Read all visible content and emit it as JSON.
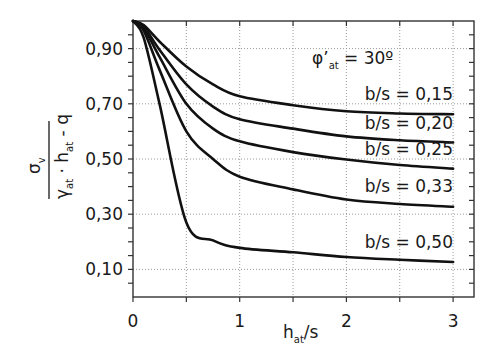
{
  "chart_data": {
    "type": "line",
    "title": "",
    "xlabel": "h_at/s",
    "ylabel": "σ_v / (γ_at · h_at - q)",
    "xlim": [
      0,
      3.2
    ],
    "ylim": [
      0,
      1.0
    ],
    "x_ticks": [
      "0",
      "1",
      "2",
      "3"
    ],
    "y_ticks": [
      "0,10",
      "0,30",
      "0,50",
      "0,70",
      "0,90"
    ],
    "grid": true,
    "annotation": "φ'at = 30º",
    "x": [
      0,
      0.1,
      0.25,
      0.5,
      0.75,
      1.0,
      1.5,
      2.0,
      2.5,
      3.0
    ],
    "series": [
      {
        "name": "b/s = 0,15",
        "values": [
          1.0,
          0.985,
          0.925,
          0.835,
          0.77,
          0.727,
          0.695,
          0.673,
          0.665,
          0.662
        ]
      },
      {
        "name": "b/s = 0,20",
        "values": [
          1.0,
          0.98,
          0.895,
          0.77,
          0.69,
          0.644,
          0.61,
          0.582,
          0.568,
          0.56
        ]
      },
      {
        "name": "b/s = 0,25",
        "values": [
          1.0,
          0.975,
          0.869,
          0.7,
          0.61,
          0.564,
          0.525,
          0.498,
          0.478,
          0.465
        ]
      },
      {
        "name": "b/s = 0,33",
        "values": [
          1.0,
          0.965,
          0.822,
          0.6,
          0.5,
          0.436,
          0.39,
          0.353,
          0.337,
          0.327
        ]
      },
      {
        "name": "b/s = 0,50",
        "values": [
          1.0,
          0.94,
          0.698,
          0.27,
          0.205,
          0.178,
          0.162,
          0.145,
          0.135,
          0.127
        ]
      }
    ]
  },
  "labels": {
    "annotation_main": "φ",
    "annotation_prime": "’",
    "annotation_sub": "at",
    "annotation_rest": " = 30º",
    "ylabel_num": "σ",
    "ylabel_num_sub": "v",
    "ylabel_den_gamma": "γ",
    "ylabel_den_sub1": "at",
    "ylabel_den_mid": " · h",
    "ylabel_den_sub2": "at",
    "ylabel_den_end": " - q",
    "xlabel_main": "h",
    "xlabel_sub": "at",
    "xlabel_end": "/s"
  }
}
